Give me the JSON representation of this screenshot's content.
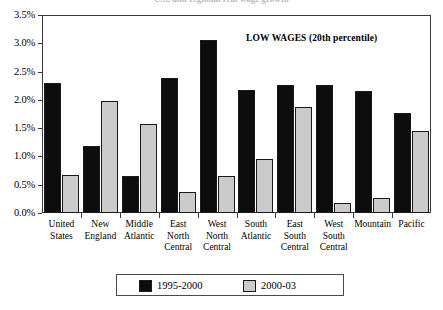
{
  "clipped_header": "U.S. and regional real wage growth",
  "annotation": "LOW WAGES (20th percentile)",
  "legend": {
    "position": "bottom-center",
    "entries": [
      {
        "label": "1995-2000",
        "color": "#0d0d0d"
      },
      {
        "label": "2000-03",
        "color": "#cbcbcb"
      }
    ]
  },
  "yticks": [
    "0.0%",
    "0.5%",
    "1.0%",
    "1.5%",
    "2.0%",
    "2.5%",
    "3.0%",
    "3.5%"
  ],
  "chart_data": {
    "type": "bar",
    "title": "",
    "subtitle": "LOW WAGES (20th percentile)",
    "xlabel": "",
    "ylabel": "",
    "ylim": [
      0,
      3.5
    ],
    "ytick_values": [
      0.0,
      0.5,
      1.0,
      1.5,
      2.0,
      2.5,
      3.0,
      3.5
    ],
    "ytick_labels": [
      "0.0%",
      "0.5%",
      "1.0%",
      "1.5%",
      "2.0%",
      "2.5%",
      "3.0%",
      "3.5%"
    ],
    "grid": false,
    "legend_position": "bottom-center",
    "categories": [
      "United States",
      "New England",
      "Middle Atlantic",
      "East North Central",
      "West North Central",
      "South Atlantic",
      "East South Central",
      "West South Central",
      "Mountain",
      "Pacific"
    ],
    "category_label_lines": [
      [
        "United",
        "States"
      ],
      [
        "New",
        "England"
      ],
      [
        "Middle",
        "Atlantic"
      ],
      [
        "East",
        "North",
        "Central"
      ],
      [
        "West",
        "North",
        "Central"
      ],
      [
        "South",
        "Atlantic"
      ],
      [
        "East",
        "South",
        "Central"
      ],
      [
        "West",
        "South",
        "Central"
      ],
      [
        "Mountain"
      ],
      [
        "Pacific"
      ]
    ],
    "series": [
      {
        "name": "1995-2000",
        "color": "#0d0d0d",
        "values": [
          2.3,
          1.18,
          0.66,
          2.38,
          3.05,
          2.18,
          2.27,
          2.27,
          2.16,
          1.76
        ]
      },
      {
        "name": "2000-03",
        "color": "#cbcbcb",
        "values": [
          0.67,
          1.98,
          1.58,
          0.37,
          0.66,
          0.96,
          1.87,
          0.18,
          0.26,
          1.45
        ]
      }
    ]
  }
}
